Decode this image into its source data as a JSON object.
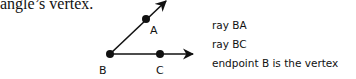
{
  "intro_text": "angle’s vertex.",
  "figure": {
    "points": {
      "B": {
        "label": "B",
        "x": 110,
        "y": 54
      },
      "A": {
        "label": "A",
        "x": 146,
        "y": 19
      },
      "C": {
        "label": "C",
        "x": 160,
        "y": 54
      }
    },
    "rays": [
      {
        "name": "ray BA",
        "from": "B",
        "through": "A",
        "tip": [
          166,
          0
        ]
      },
      {
        "name": "ray BC",
        "from": "B",
        "through": "C",
        "tip": [
          193,
          54
        ]
      }
    ],
    "color": "#111111"
  },
  "notes": [
    "ray BA",
    "ray BC",
    "endpoint B is the vertex"
  ]
}
